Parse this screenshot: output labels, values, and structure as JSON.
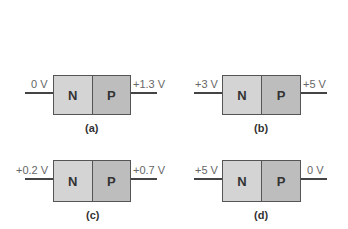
{
  "panels": [
    {
      "id": "a",
      "caption": "(a)",
      "n_label": "N",
      "p_label": "P",
      "left_voltage": "0 V",
      "right_voltage": "+1.3 V"
    },
    {
      "id": "b",
      "caption": "(b)",
      "n_label": "N",
      "p_label": "P",
      "left_voltage": "+3 V",
      "right_voltage": "+5 V"
    },
    {
      "id": "c",
      "caption": "(c)",
      "n_label": "N",
      "p_label": "P",
      "left_voltage": "+0.2 V",
      "right_voltage": "+0.7 V"
    },
    {
      "id": "d",
      "caption": "(d)",
      "n_label": "N",
      "p_label": "P",
      "left_voltage": "+5 V",
      "right_voltage": "0 V"
    }
  ]
}
